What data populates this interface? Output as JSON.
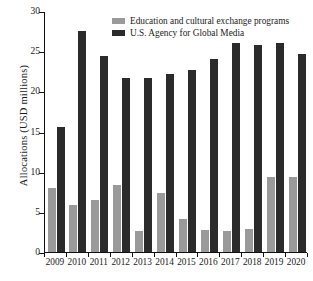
{
  "chart_data": {
    "type": "bar",
    "title": "",
    "xlabel": "",
    "ylabel": "Allocations (USD millions)",
    "ylim": [
      0,
      30
    ],
    "yticks": [
      0,
      5,
      10,
      15,
      20,
      25,
      30
    ],
    "ytick_labels": [
      "0",
      "5",
      "10",
      "15",
      "20",
      "25",
      "30"
    ],
    "grid": false,
    "legend_position": "top-center",
    "categories": [
      "2009",
      "2010",
      "2011",
      "2012",
      "2013",
      "2014",
      "2015",
      "2016",
      "2017",
      "2018",
      "2019",
      "2020"
    ],
    "series": [
      {
        "name": "Education and cultural exchange programs",
        "color": "#9a9a9a",
        "values": [
          8.0,
          5.8,
          6.5,
          8.3,
          2.6,
          7.4,
          4.1,
          2.8,
          2.6,
          2.9,
          9.3,
          9.3
        ]
      },
      {
        "name": "U.S. Agency for Global Media",
        "color": "#2b2b2b",
        "values": [
          15.5,
          27.5,
          24.4,
          21.6,
          21.6,
          22.1,
          22.7,
          24.0,
          26.0,
          25.8,
          26.0,
          24.7
        ]
      }
    ]
  },
  "legend": {
    "items": [
      {
        "label": "Education and cultural exchange programs",
        "color": "#9a9a9a"
      },
      {
        "label": "U.S. Agency for Global Media",
        "color": "#2b2b2b"
      }
    ]
  },
  "axes": {
    "y_title": "Allocations (USD millions)"
  }
}
